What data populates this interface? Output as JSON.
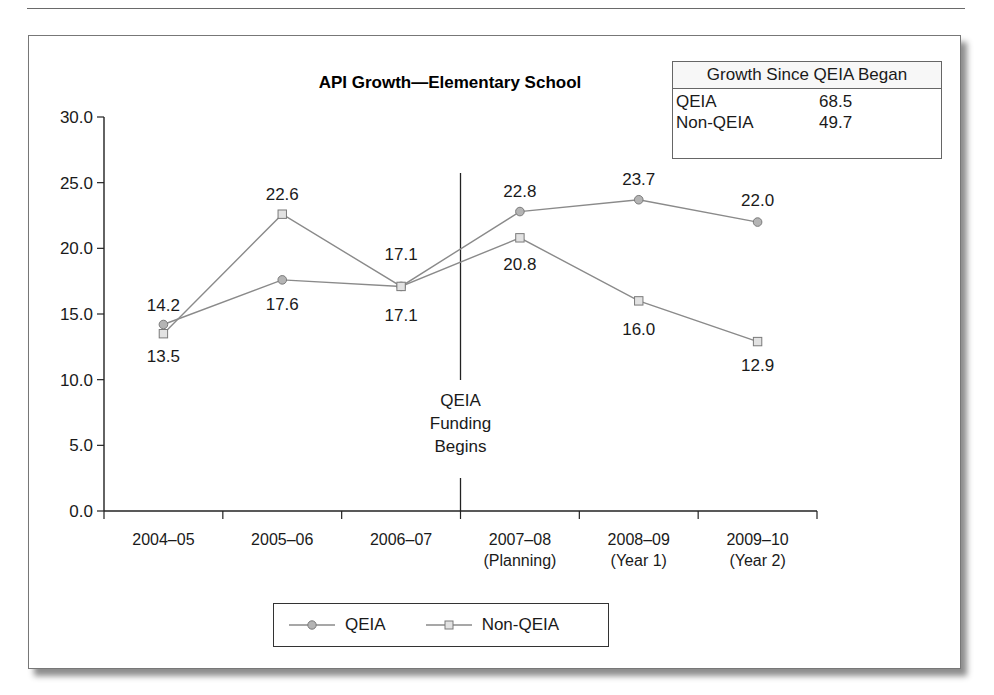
{
  "chart_data": {
    "type": "line",
    "title": "API Growth—Elementary School",
    "xlabel": "",
    "ylabel": "",
    "ylim": [
      0,
      30
    ],
    "yticks": [
      "0.0",
      "5.0",
      "10.0",
      "15.0",
      "20.0",
      "25.0",
      "30.0"
    ],
    "categories": [
      [
        "2004–05"
      ],
      [
        "2005–06"
      ],
      [
        "2006–07"
      ],
      [
        "2007–08",
        "(Planning)"
      ],
      [
        "2008–09",
        "(Year 1)"
      ],
      [
        "2009–10",
        "(Year 2)"
      ]
    ],
    "series": [
      {
        "name": "QEIA",
        "marker": "circle",
        "values": [
          14.2,
          17.6,
          17.1,
          22.8,
          23.7,
          22.0
        ]
      },
      {
        "name": "Non-QEIA",
        "marker": "square",
        "values": [
          13.5,
          22.6,
          17.1,
          20.8,
          16.0,
          12.9
        ]
      }
    ],
    "annotation": {
      "text": [
        "QEIA",
        "Funding",
        "Begins"
      ],
      "position": "between 2006–07 and 2007–08"
    },
    "grid": false,
    "legend_position": "bottom"
  },
  "growth_box": {
    "header": "Growth Since QEIA Began",
    "rows": [
      {
        "label": "QEIA",
        "value": "68.5"
      },
      {
        "label": "Non-QEIA",
        "value": "49.7"
      }
    ]
  },
  "legend": {
    "items": [
      {
        "label": "QEIA",
        "icon": "circle-marker-icon"
      },
      {
        "label": "Non-QEIA",
        "icon": "square-marker-icon"
      }
    ]
  },
  "colors": {
    "line": "#8a8a8a",
    "qeia_marker_fill": "#b4b4b4",
    "nonqeia_marker_fill": "#e2e2e2",
    "marker_stroke": "#7a7a7a",
    "axis": "#222222"
  }
}
